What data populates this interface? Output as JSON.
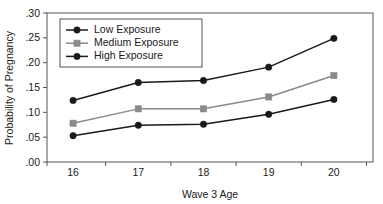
{
  "chart_data": {
    "type": "line",
    "title": "",
    "xlabel": "Wave 3 Age",
    "ylabel": "Probability of Pregnancy",
    "categories": [
      "16",
      "17",
      "18",
      "19",
      "20"
    ],
    "x": [
      16,
      17,
      18,
      19,
      20
    ],
    "xlim": [
      15.6,
      20.6
    ],
    "ylim": [
      0.0,
      0.3
    ],
    "grid": false,
    "legend_position": "top-left-inside",
    "y_tick_labels": [
      ".00",
      ".05",
      ".10",
      ".15",
      ".20",
      ".25",
      ".30"
    ],
    "y_tick_values": [
      0.0,
      0.05,
      0.1,
      0.15,
      0.2,
      0.25,
      0.3
    ],
    "x_tick_labels": [
      "16",
      "17",
      "18",
      "19",
      "20"
    ],
    "series": [
      {
        "name": "Low Exposure",
        "marker": "circle",
        "color": "#1a1a1a",
        "values": [
          0.053,
          0.074,
          0.076,
          0.096,
          0.126
        ]
      },
      {
        "name": "Medium Exposure",
        "marker": "square",
        "color": "#8a8a8a",
        "values": [
          0.078,
          0.107,
          0.107,
          0.131,
          0.174
        ]
      },
      {
        "name": "High Exposure",
        "marker": "circle",
        "color": "#1a1a1a",
        "values": [
          0.124,
          0.16,
          0.164,
          0.191,
          0.249
        ]
      }
    ]
  },
  "legend": {
    "entries": [
      {
        "label": "Low Exposure"
      },
      {
        "label": "Medium Exposure"
      },
      {
        "label": "High Exposure"
      }
    ]
  },
  "axes": {
    "x_title": "Wave 3 Age",
    "y_title": "Probability of Pregnancy"
  }
}
